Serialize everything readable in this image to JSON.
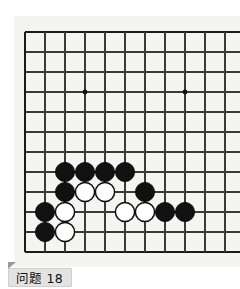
{
  "figure": {
    "caption": "问题 18",
    "kind": "go-board-diagram"
  },
  "colors": {
    "page_background": "#ffffff",
    "board_background": "#f4f4f2",
    "grid_line": "#3a3a3a",
    "border_line": "#1a1a1a",
    "star_point": "#101010",
    "black_stone": "#111111",
    "black_stone_edge": "#000000",
    "white_stone": "#ffffff",
    "white_stone_edge": "#0d0d0d",
    "caption_background": "#e3e3e1",
    "caption_border": "#cfcfcd",
    "caption_text": "#101010"
  },
  "board": {
    "label": "go-board",
    "origin_x": 25,
    "origin_y": 32,
    "spacing": 20,
    "cols": 11,
    "rows": 12,
    "stone_radius": 9.6,
    "star_radius": 2.4,
    "edges": {
      "left": true,
      "top": true,
      "bottom": true,
      "right": false
    },
    "star_points": [
      {
        "col": 3,
        "row": 3
      },
      {
        "col": 8,
        "row": 3
      },
      {
        "col": 8,
        "row": 9
      }
    ],
    "stones": [
      {
        "color": "black",
        "col": 2,
        "row": 7
      },
      {
        "color": "black",
        "col": 3,
        "row": 7
      },
      {
        "color": "black",
        "col": 4,
        "row": 7
      },
      {
        "color": "black",
        "col": 5,
        "row": 7
      },
      {
        "color": "black",
        "col": 2,
        "row": 8
      },
      {
        "color": "white",
        "col": 3,
        "row": 8
      },
      {
        "color": "white",
        "col": 4,
        "row": 8
      },
      {
        "color": "black",
        "col": 6,
        "row": 8
      },
      {
        "color": "black",
        "col": 1,
        "row": 9
      },
      {
        "color": "white",
        "col": 2,
        "row": 9
      },
      {
        "color": "white",
        "col": 5,
        "row": 9
      },
      {
        "color": "white",
        "col": 6,
        "row": 9
      },
      {
        "color": "black",
        "col": 7,
        "row": 9
      },
      {
        "color": "black",
        "col": 8,
        "row": 9
      },
      {
        "color": "black",
        "col": 1,
        "row": 10
      },
      {
        "color": "white",
        "col": 2,
        "row": 10
      }
    ]
  }
}
